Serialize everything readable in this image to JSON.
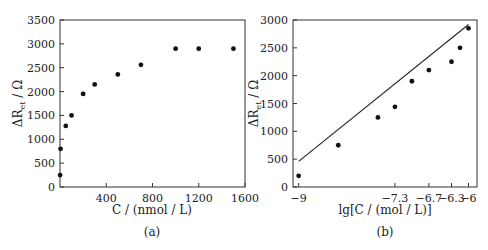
{
  "chart_data": [
    {
      "type": "scatter",
      "panel_label": "(a)",
      "title": "",
      "xlabel": "C / (nmol / L)",
      "ylabel": "ΔR_et / Ω",
      "xlim": [
        0,
        1600
      ],
      "ylim": [
        0,
        3500
      ],
      "xticks": [
        400,
        800,
        1200,
        1600
      ],
      "yticks": [
        0,
        500,
        1000,
        1500,
        2000,
        2500,
        3000,
        3500
      ],
      "grid": false,
      "x": [
        1,
        5,
        50,
        100,
        200,
        300,
        500,
        700,
        1000,
        1200,
        1500
      ],
      "y": [
        250,
        800,
        1280,
        1500,
        1950,
        2150,
        2360,
        2560,
        2900,
        2900,
        2900
      ]
    },
    {
      "type": "scatter",
      "panel_label": "(b)",
      "title": "",
      "xlabel": "lg[C / (mol / L)]",
      "ylabel": "ΔR_et / Ω",
      "xlim": [
        -9.1,
        -5.85
      ],
      "ylim": [
        0,
        3000
      ],
      "xticks": [
        -9,
        -7.3,
        -6.7,
        -6.3,
        -6
      ],
      "xtick_labels": [
        "−9",
        "−7.3",
        "−6.7",
        "−6.3",
        "−6"
      ],
      "yticks": [
        0,
        500,
        1000,
        1500,
        2000,
        2500,
        3000
      ],
      "grid": false,
      "x": [
        -9.0,
        -8.3,
        -7.6,
        -7.3,
        -7.0,
        -6.7,
        -6.3,
        -6.15,
        -6.0
      ],
      "y": [
        200,
        750,
        1250,
        1440,
        1900,
        2100,
        2250,
        2500,
        2850
      ],
      "fit_line": {
        "x": [
          -9.0,
          -6.0
        ],
        "y": [
          460,
          2920
        ]
      }
    }
  ]
}
